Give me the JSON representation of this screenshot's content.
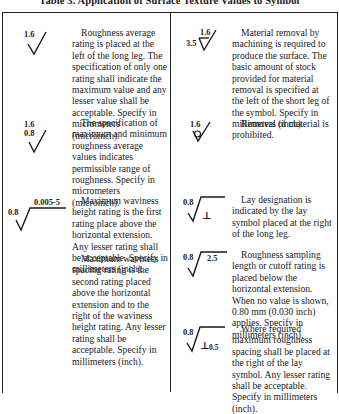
{
  "title": "Table 3. Application of Surface Texture Values to Symbol",
  "left_column": [
    {
      "symbol": {
        "name": "roughness-average-symbol",
        "labels": [
          "1.6"
        ]
      },
      "text": "Roughness average rating is placed at the left of the long leg. The specification of only one rating shall indicate the maximum value and any lesser value shall be acceptable. Specify in micrometers (microinch)."
    },
    {
      "symbol": {
        "name": "max-min-roughness-symbol",
        "labels": [
          "1.6",
          "0.8"
        ]
      },
      "text": "The specification of maximum and minimum roughness average values indicates permissible range of roughness. Specify in micrometers (microinch)."
    },
    {
      "symbol": {
        "name": "waviness-symbol",
        "labels": [
          "0.8",
          "0.005-5"
        ]
      },
      "text": "Maximum waviness height rating is the first rating place above the horizontal extension. Any lesser rating shall be acceptable. Specify in millimeters (inch).",
      "text2": "Maximum waviness spacing rating is the second rating placed above the horizontal extension and to the right of the waviness height rating. Any lesser rating shall be acceptable. Specify in millimeters (inch)."
    }
  ],
  "right_column": [
    {
      "symbol": {
        "name": "material-removal-symbol",
        "labels": [
          "1.6",
          "3.5"
        ]
      },
      "text": "Material removal by machining is required to produce the surface. The basic amount of stock provided for material removal is specified at the left of the short leg of the symbol. Specify in millimeters (inch)."
    },
    {
      "symbol": {
        "name": "removal-prohibited-symbol",
        "labels": [
          "1.6"
        ]
      },
      "text": "Removal of material is prohibited."
    },
    {
      "symbol": {
        "name": "lay-designation-symbol",
        "labels": [
          "0.8",
          "⊥"
        ]
      },
      "text": "Lay designation is indicated by the lay symbol placed at the right of the long leg."
    },
    {
      "symbol": {
        "name": "sampling-length-symbol",
        "labels": [
          "0.8",
          "2.5"
        ]
      },
      "text": "Roughness sampling length or cutoff rating is placed below the horizontal extension. When no value is shown, 0.80 mm (0.030 inch) applies. Specify in millimeters (inch)."
    },
    {
      "symbol": {
        "name": "roughness-spacing-symbol",
        "labels": [
          "0.8",
          "⊥",
          "0.5"
        ]
      },
      "text": "Where required maximum roughness spacing shall be placed at the right of the lay symbol. Any lesser rating shall be acceptable. Specify in millimeters (inch)."
    }
  ]
}
